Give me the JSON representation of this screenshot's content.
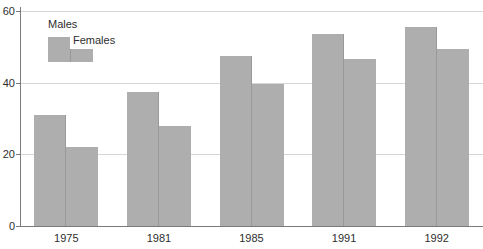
{
  "chart_data": {
    "type": "bar",
    "title": "",
    "xlabel": "",
    "ylabel": "",
    "categories": [
      "1975",
      "1981",
      "1985",
      "1991",
      "1992"
    ],
    "series": [
      {
        "name": "Males",
        "values": [
          31,
          37.5,
          47.5,
          53.5,
          55.5
        ]
      },
      {
        "name": "Females",
        "values": [
          22,
          28,
          39.5,
          46.5,
          49.5
        ]
      }
    ],
    "ylim": [
      0,
      60
    ],
    "yticks": [
      0,
      20,
      40,
      60
    ],
    "grid": true,
    "legend_position": "top-left",
    "colors": {
      "bar": "#aeaeae",
      "bar_edge": "#999999",
      "grid": "#d6d6d6",
      "axis": "#7b7b7b",
      "text": "#2e2e2e"
    }
  }
}
